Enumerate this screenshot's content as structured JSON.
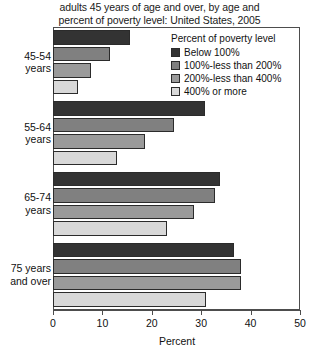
{
  "chart_data": {
    "type": "bar",
    "orientation": "horizontal",
    "title": "adults 45 years of age and over, by age and percent of poverty level: United States, 2005",
    "title_lines": [
      "adults 45 years of age and over, by age and",
      "percent of poverty level: United States, 2005"
    ],
    "xlabel": "Percent",
    "ylabel": "",
    "xlim": [
      0,
      50
    ],
    "xticks": [
      0,
      10,
      20,
      30,
      40,
      50
    ],
    "xtick_labels": [
      "0",
      "10",
      "20",
      "30",
      "40",
      "50"
    ],
    "grid": false,
    "legend_position": "top-right",
    "legend_title": "Percent of poverty level",
    "categories": [
      "45-54 years",
      "55-64 years",
      "65-74 years",
      "75 years and over"
    ],
    "category_label_lines": [
      [
        "45-54",
        "years"
      ],
      [
        "55-64",
        "years"
      ],
      [
        "65-74",
        "years"
      ],
      [
        "75 years",
        "and over"
      ]
    ],
    "series": [
      {
        "name": "Below 100%",
        "color": "#333333",
        "values": [
          15.5,
          30.8,
          33.8,
          36.6
        ]
      },
      {
        "name": "100%-less than 200%",
        "color": "#808080",
        "values": [
          11.5,
          24.5,
          32.8,
          38.0
        ]
      },
      {
        "name": "200%-less than 400%",
        "color": "#9a9a9a",
        "values": [
          7.7,
          18.6,
          28.5,
          38.0
        ]
      },
      {
        "name": "400% or more",
        "color": "#d8d8d8",
        "values": [
          5.1,
          13.0,
          23.0,
          31.0
        ]
      }
    ]
  }
}
